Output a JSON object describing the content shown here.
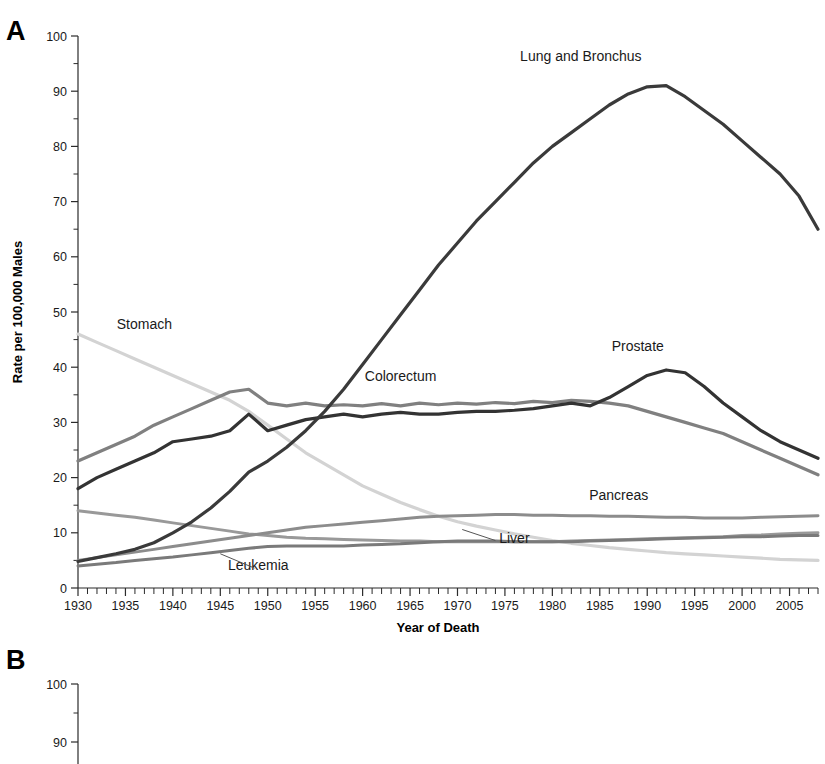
{
  "figure": {
    "panels": [
      {
        "letter": "A",
        "y_axis_title": "Rate per 100,000 Males",
        "x_axis_title": "Year of Death"
      },
      {
        "letter": "B",
        "y_axis_title": "",
        "x_axis_title": ""
      }
    ]
  },
  "chart_data": {
    "type": "line",
    "title": "",
    "subtitle": "",
    "xlabel": "Year of Death",
    "ylabel": "Rate per 100,000 Males",
    "xlim": [
      1930,
      2008
    ],
    "ylim": [
      0,
      100
    ],
    "grid": false,
    "legend_position": "inline-annotations",
    "x_ticks_major": [
      1930,
      1935,
      1940,
      1945,
      1950,
      1955,
      1960,
      1965,
      1970,
      1975,
      1980,
      1985,
      1990,
      1995,
      2000,
      2005
    ],
    "x_tick_interval_minor": 1,
    "y_ticks_major": [
      0,
      10,
      20,
      30,
      40,
      50,
      60,
      70,
      80,
      90,
      100
    ],
    "y_tick_interval_minor": 5,
    "x": [
      1930,
      1932,
      1934,
      1936,
      1938,
      1940,
      1942,
      1944,
      1946,
      1948,
      1950,
      1952,
      1954,
      1956,
      1958,
      1960,
      1962,
      1964,
      1966,
      1968,
      1970,
      1972,
      1974,
      1976,
      1978,
      1980,
      1982,
      1984,
      1986,
      1988,
      1990,
      1992,
      1994,
      1996,
      1998,
      2000,
      2002,
      2004,
      2006,
      2008
    ],
    "series": [
      {
        "name": "Lung and Bronchus",
        "color": "#3a3a3a",
        "width": 3.2,
        "label_x": 1983,
        "label_y": 95.5,
        "values": [
          4.8,
          5.5,
          6.2,
          7.0,
          8.2,
          10.0,
          12.0,
          14.5,
          17.5,
          21.0,
          23.0,
          25.5,
          28.5,
          32.0,
          36.0,
          40.5,
          45.0,
          49.5,
          54.0,
          58.5,
          62.5,
          66.5,
          70.0,
          73.5,
          77.0,
          80.0,
          82.5,
          85.0,
          87.5,
          89.5,
          90.8,
          91.0,
          89.0,
          86.5,
          84.0,
          81.0,
          78.0,
          75.0,
          71.0,
          65.0
        ]
      },
      {
        "name": "Stomach",
        "color": "#d3d3d3",
        "width": 3.2,
        "label_x": 1937,
        "label_y": 47.0,
        "values": [
          46.0,
          44.5,
          43.0,
          41.5,
          40.0,
          38.5,
          37.0,
          35.5,
          34.0,
          32.0,
          29.5,
          27.0,
          24.5,
          22.5,
          20.5,
          18.5,
          17.0,
          15.5,
          14.2,
          13.0,
          12.0,
          11.2,
          10.5,
          9.8,
          9.2,
          8.6,
          8.1,
          7.7,
          7.3,
          7.0,
          6.7,
          6.4,
          6.2,
          6.0,
          5.8,
          5.6,
          5.4,
          5.2,
          5.1,
          5.0
        ]
      },
      {
        "name": "Colorectum",
        "color": "#808080",
        "width": 3.2,
        "label_x": 1964,
        "label_y": 37.5,
        "values": [
          23.0,
          24.5,
          26.0,
          27.5,
          29.5,
          31.0,
          32.5,
          34.0,
          35.5,
          36.0,
          33.5,
          33.0,
          33.5,
          33.0,
          33.2,
          33.0,
          33.4,
          33.0,
          33.5,
          33.2,
          33.5,
          33.3,
          33.6,
          33.4,
          33.8,
          33.6,
          34.0,
          33.8,
          33.5,
          33.0,
          32.0,
          31.0,
          30.0,
          29.0,
          28.0,
          26.5,
          25.0,
          23.5,
          22.0,
          20.5
        ]
      },
      {
        "name": "Prostate",
        "color": "#333333",
        "width": 3.2,
        "label_x": 1989,
        "label_y": 43.0,
        "values": [
          18.0,
          20.0,
          21.5,
          23.0,
          24.5,
          26.5,
          27.0,
          27.5,
          28.5,
          31.5,
          28.5,
          29.5,
          30.5,
          31.0,
          31.5,
          31.0,
          31.5,
          31.8,
          31.5,
          31.5,
          31.8,
          32.0,
          32.0,
          32.2,
          32.5,
          33.0,
          33.5,
          33.0,
          34.5,
          36.5,
          38.5,
          39.5,
          39.0,
          36.5,
          33.5,
          31.0,
          28.5,
          26.5,
          25.0,
          23.5
        ]
      },
      {
        "name": "Pancreas",
        "color": "#8c8c8c",
        "width": 3.0,
        "label_x": 1987,
        "label_y": 16.0,
        "values": [
          5.0,
          5.5,
          6.0,
          6.5,
          7.0,
          7.5,
          8.0,
          8.5,
          9.0,
          9.5,
          10.0,
          10.5,
          11.0,
          11.3,
          11.6,
          11.9,
          12.2,
          12.5,
          12.8,
          13.0,
          13.1,
          13.2,
          13.3,
          13.3,
          13.2,
          13.2,
          13.1,
          13.1,
          13.0,
          13.0,
          12.9,
          12.8,
          12.8,
          12.7,
          12.7,
          12.7,
          12.8,
          12.9,
          13.0,
          13.1
        ]
      },
      {
        "name": "Liver",
        "color": "#999999",
        "width": 3.0,
        "label_x": 1976,
        "label_y": 8.2,
        "values": [
          14.0,
          13.6,
          13.2,
          12.8,
          12.3,
          11.8,
          11.3,
          10.8,
          10.3,
          9.8,
          9.5,
          9.2,
          9.0,
          8.9,
          8.8,
          8.7,
          8.6,
          8.5,
          8.5,
          8.4,
          8.4,
          8.4,
          8.4,
          8.4,
          8.4,
          8.4,
          8.5,
          8.6,
          8.7,
          8.8,
          8.9,
          9.0,
          9.1,
          9.2,
          9.3,
          9.5,
          9.6,
          9.8,
          9.9,
          10.0
        ]
      },
      {
        "name": "Leukemia",
        "color": "#7a7a7a",
        "width": 3.0,
        "label_x": 1949,
        "label_y": 3.2,
        "values": [
          4.0,
          4.3,
          4.6,
          5.0,
          5.3,
          5.6,
          6.0,
          6.4,
          6.8,
          7.2,
          7.5,
          7.6,
          7.6,
          7.6,
          7.6,
          7.8,
          7.9,
          8.0,
          8.2,
          8.4,
          8.5,
          8.5,
          8.5,
          8.4,
          8.4,
          8.4,
          8.4,
          8.5,
          8.6,
          8.7,
          8.8,
          8.9,
          9.0,
          9.1,
          9.2,
          9.3,
          9.3,
          9.4,
          9.5,
          9.5
        ]
      }
    ],
    "annotations": [
      {
        "text": "Lung and Bronchus",
        "x": 1983,
        "y": 95.5,
        "leader": false
      },
      {
        "text": "Stomach",
        "x": 1937,
        "y": 47.0,
        "leader": false
      },
      {
        "text": "Colorectum",
        "x": 1964,
        "y": 37.5,
        "leader": false
      },
      {
        "text": "Prostate",
        "x": 1989,
        "y": 43.0,
        "leader": false
      },
      {
        "text": "Pancreas",
        "x": 1987,
        "y": 16.0,
        "leader": false
      },
      {
        "text": "Liver",
        "x": 1976,
        "y": 8.2,
        "leader": true
      },
      {
        "text": "Leukemia",
        "x": 1949,
        "y": 3.2,
        "leader": true
      }
    ]
  },
  "panel_b": {
    "letter": "B",
    "y_ticks_visible": [
      "100",
      "90"
    ],
    "ylim": [
      0,
      100
    ]
  }
}
